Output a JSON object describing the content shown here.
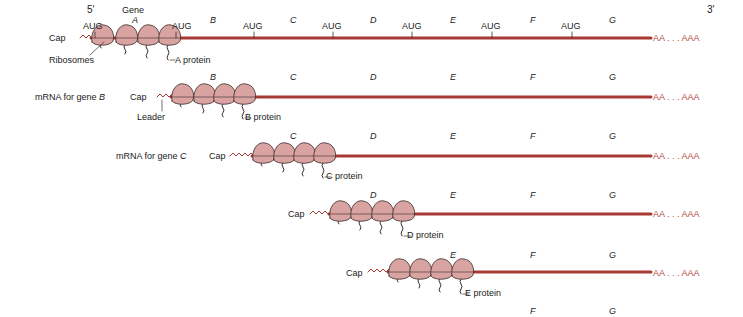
{
  "diagram": {
    "title_markers": {
      "five_prime": "5′",
      "three_prime": "3′",
      "gene_header": "Gene"
    },
    "colors": {
      "mrna": "#a83a36",
      "ribosome_fill": "#d9a3a1",
      "ribosome_stroke": "#3a2a2a",
      "polyA": "#b5483f",
      "text": "#222222"
    },
    "genes": [
      "A",
      "B",
      "C",
      "D",
      "E",
      "F",
      "G"
    ],
    "start_codon": "AUG",
    "cap_label": "Cap",
    "polyA_label": "AA . . . AAA",
    "ribosomes_label": "Ribosomes",
    "leader_label": "Leader",
    "rows": [
      {
        "id": "full",
        "name_label": "",
        "protein_label": "A protein"
      },
      {
        "id": "B",
        "name_prefix": "mRNA for  gene ",
        "name_gene": "B",
        "protein_label": "B protein"
      },
      {
        "id": "C",
        "name_prefix": "mRNA for  gene ",
        "name_gene": "C",
        "protein_label": "C protein"
      },
      {
        "id": "D",
        "protein_label": "D protein"
      },
      {
        "id": "E",
        "protein_label": "E protein"
      },
      {
        "id": "F",
        "protein_label": ""
      }
    ]
  }
}
